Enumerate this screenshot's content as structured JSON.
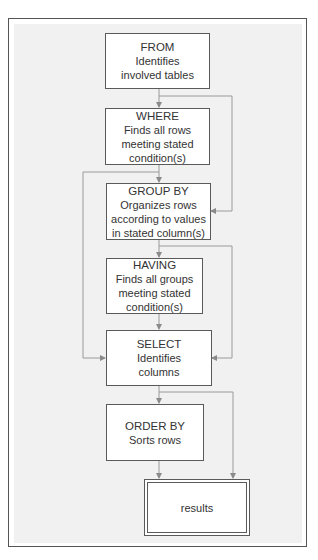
{
  "diagram": {
    "type": "flowchart",
    "steps": [
      {
        "id": "from",
        "title": "FROM",
        "desc": "Identifies\ninvolved tables"
      },
      {
        "id": "where",
        "title": "WHERE",
        "desc": "Finds all rows\nmeeting stated\ncondition(s)"
      },
      {
        "id": "group_by",
        "title": "GROUP BY",
        "desc": "Organizes rows\naccording to values\nin stated column(s)"
      },
      {
        "id": "having",
        "title": "HAVING",
        "desc": "Finds all groups\nmeeting stated\ncondition(s)"
      },
      {
        "id": "select",
        "title": "SELECT",
        "desc": "Identifies\ncolumns"
      },
      {
        "id": "order_by",
        "title": "ORDER BY",
        "desc": "Sorts rows"
      }
    ],
    "result": {
      "label": "results"
    },
    "edges": [
      {
        "from": "FROM",
        "to": "WHERE"
      },
      {
        "from": "FROM",
        "to": "GROUP BY",
        "note": "bypass right (skip WHERE)"
      },
      {
        "from": "WHERE",
        "to": "GROUP BY"
      },
      {
        "from": "WHERE",
        "to": "SELECT",
        "note": "bypass left (skip GROUP BY, HAVING)"
      },
      {
        "from": "GROUP BY",
        "to": "HAVING"
      },
      {
        "from": "GROUP BY",
        "to": "SELECT",
        "note": "bypass right (skip HAVING)"
      },
      {
        "from": "HAVING",
        "to": "SELECT"
      },
      {
        "from": "SELECT",
        "to": "ORDER BY"
      },
      {
        "from": "SELECT",
        "to": "results",
        "note": "bypass right (skip ORDER BY)"
      },
      {
        "from": "ORDER BY",
        "to": "results"
      }
    ],
    "colors": {
      "frame_border": "#555555",
      "panel_background": "#f1f1f1",
      "box_border": "#5a5a5a",
      "connector": "#999999",
      "text": "#333333"
    }
  }
}
